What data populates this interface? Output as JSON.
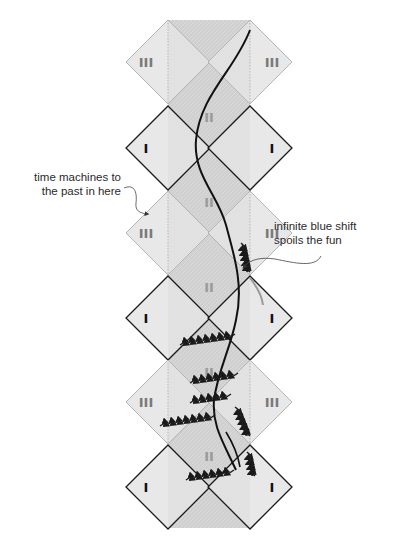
{
  "diagram": {
    "type": "penrose-diagram",
    "regions": {
      "exterior_label": "I",
      "between_horizons_label": "II",
      "inner_label": "III"
    },
    "rows": [
      {
        "kind": "III",
        "cy": 62
      },
      {
        "kind": "I",
        "cy": 148
      },
      {
        "kind": "III",
        "cy": 233
      },
      {
        "kind": "I",
        "cy": 318
      },
      {
        "kind": "III",
        "cy": 402
      },
      {
        "kind": "I",
        "cy": 487
      }
    ],
    "colors": {
      "outer_fill": "#e4e4e4",
      "inner_fill": "#cfcfcf",
      "I_edge": "#1a1a1a",
      "III_edge": "#b4b4b4",
      "III_label": "#7a7a7a",
      "II_label": "#9a9a9a",
      "I_label": "#111111",
      "worldline": "#111111"
    }
  },
  "annotations": {
    "time_machines": "time machines to the past in here",
    "blue_shift": "infinite blue shift spoils the fun"
  }
}
